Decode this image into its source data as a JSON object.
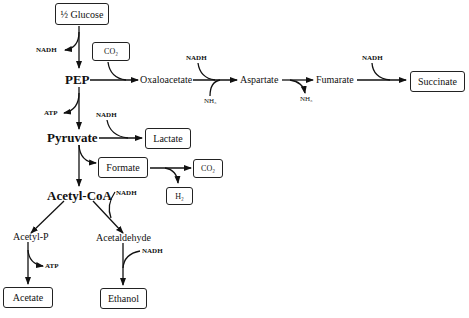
{
  "diagram": {
    "type": "metabolic-pathway",
    "nodes": {
      "glucose": "½ Glucose",
      "pep": "PEP",
      "pyruvate": "Pyruvate",
      "acetyl_coa": "Acetyl-CoA",
      "oxaloacetate": "Oxaloacetate",
      "aspartate": "Aspartate",
      "fumarate": "Fumarate",
      "succinate": "Succinate",
      "lactate": "Lactate",
      "formate": "Formate",
      "co2_formate": "CO₂",
      "h2": "H₂",
      "co2_input": "CO₂",
      "acetyl_p": "Acetyl-P",
      "acetate": "Acetate",
      "acetaldehyde": "Acetaldehyde",
      "ethanol": "Ethanol"
    },
    "cofactors": {
      "nadh_glucose_pep": "NADH",
      "atp_pep_pyruvate": "ATP",
      "nadh_oxaloacetate_aspartate": "NADH",
      "nh3_in": "NH₃",
      "nh3_out": "NH₃",
      "nadh_fumarate_succinate": "NADH",
      "nadh_pyruvate_lactate": "NADH",
      "nadh_acetylcoa_acetaldehyde": "NADH",
      "atp_acetylp_acetate": "ATP",
      "nadh_acetaldehyde_ethanol": "NADH"
    },
    "edges": [
      {
        "from": "½ Glucose",
        "to": "PEP",
        "side": "NADH (out)"
      },
      {
        "from": "PEP",
        "to": "Oxaloacetate",
        "side": "CO₂ (in)"
      },
      {
        "from": "Oxaloacetate",
        "to": "Aspartate",
        "side": "NADH (in), NH₃ (in)"
      },
      {
        "from": "Aspartate",
        "to": "Fumarate",
        "side": "NH₃ (out)"
      },
      {
        "from": "Fumarate",
        "to": "Succinate",
        "side": "NADH (in)"
      },
      {
        "from": "PEP",
        "to": "Pyruvate",
        "side": "ATP (out)"
      },
      {
        "from": "Pyruvate",
        "to": "Lactate",
        "side": "NADH (in)"
      },
      {
        "from": "Pyruvate",
        "to": "Formate"
      },
      {
        "from": "Formate",
        "to": "CO₂"
      },
      {
        "from": "Formate",
        "to": "H₂"
      },
      {
        "from": "Pyruvate",
        "to": "Acetyl-CoA"
      },
      {
        "from": "Acetyl-CoA",
        "to": "Acetyl-P"
      },
      {
        "from": "Acetyl-P",
        "to": "Acetate",
        "side": "ATP (out)"
      },
      {
        "from": "Acetyl-CoA",
        "to": "Acetaldehyde",
        "side": "NADH (in)"
      },
      {
        "from": "Acetaldehyde",
        "to": "Ethanol",
        "side": "NADH (in)"
      }
    ]
  }
}
